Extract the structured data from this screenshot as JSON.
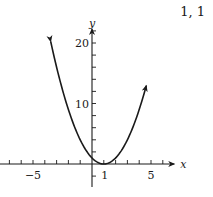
{
  "corner_label": "1, 1",
  "chart_data": {
    "type": "line",
    "title": "",
    "function": "y = (x - 1)^2",
    "xlabel": "x",
    "ylabel": "y",
    "xlim": [
      -7.8,
      6.8
    ],
    "ylim": [
      -3.8,
      22
    ],
    "x_ticks": [
      -7,
      -6,
      -5,
      -4,
      -3,
      -2,
      -1,
      1,
      2,
      3,
      4,
      5,
      6
    ],
    "x_tick_labels": [
      {
        "value": -5,
        "label": "−5"
      },
      {
        "value": 1,
        "label": "1"
      },
      {
        "value": 5,
        "label": "5"
      }
    ],
    "y_ticks": [
      -2,
      2,
      4,
      6,
      8,
      10,
      12,
      14,
      16,
      18,
      20,
      22
    ],
    "y_tick_labels": [
      {
        "value": 10,
        "label": "10"
      },
      {
        "value": 20,
        "label": "20"
      }
    ],
    "series": [
      {
        "name": "parabola",
        "x": [
          -3.5,
          -3,
          -2,
          -1,
          0,
          1,
          2,
          3,
          4,
          4.6
        ],
        "y": [
          20.25,
          16,
          9,
          4,
          1,
          0,
          1,
          4,
          9,
          12.96
        ],
        "arrows": "both-ends",
        "vertex": [
          1,
          0
        ]
      }
    ],
    "grid": false,
    "legend": null
  }
}
